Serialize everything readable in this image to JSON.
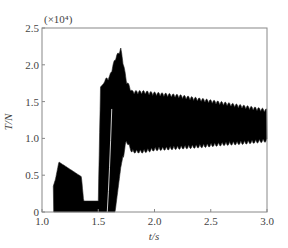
{
  "chart_data": {
    "type": "line",
    "title": "",
    "xlabel": "t/s",
    "ylabel": "T/N",
    "y_multiplier": "(×10⁴)",
    "xlim": [
      1.0,
      3.0
    ],
    "ylim": [
      0,
      2.5
    ],
    "xticks": [
      "1.0",
      "1.5",
      "2.0",
      "2.5",
      "3.0"
    ],
    "yticks": [
      "0",
      "0.5",
      "1.0",
      "1.5",
      "2.0",
      "2.5"
    ],
    "grid": false,
    "legend": null,
    "envelope": {
      "x": [
        1.1,
        1.12,
        1.15,
        1.35,
        1.37,
        1.48,
        1.5,
        1.52,
        1.55,
        1.6,
        1.65,
        1.7,
        1.75,
        1.8,
        1.9,
        2.0,
        2.2,
        2.4,
        2.6,
        2.8,
        3.0
      ],
      "upper": [
        0.35,
        0.45,
        0.68,
        0.48,
        0.15,
        0.15,
        0.15,
        1.7,
        1.75,
        1.8,
        2.05,
        2.18,
        1.75,
        1.6,
        1.6,
        1.58,
        1.55,
        1.5,
        1.45,
        1.4,
        1.35
      ],
      "lower": [
        0.0,
        0.0,
        0.0,
        0.0,
        0.0,
        0.0,
        0.0,
        0.0,
        0.0,
        0.0,
        0.0,
        0.6,
        1.0,
        0.85,
        0.85,
        0.88,
        0.9,
        0.92,
        0.95,
        0.97,
        1.0
      ]
    }
  }
}
